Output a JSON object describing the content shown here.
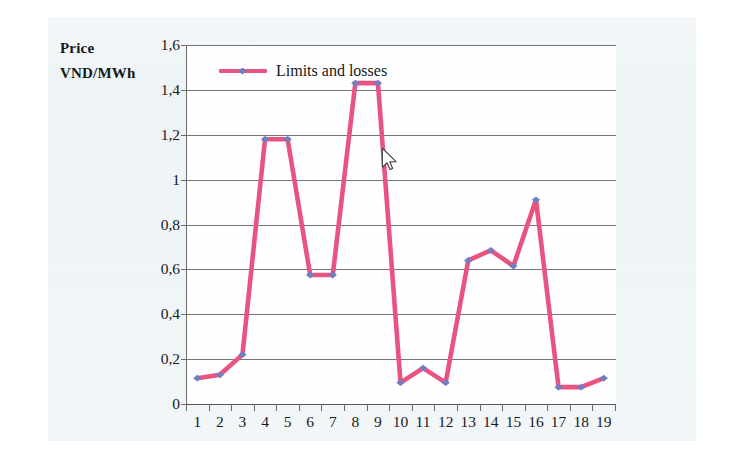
{
  "chart_data": {
    "type": "line",
    "title": "",
    "ylabel": "Price VND/MWh",
    "ylabel_lines": [
      "Price",
      "VND/MWh"
    ],
    "xlabel": "",
    "categories": [
      "1",
      "2",
      "3",
      "4",
      "5",
      "6",
      "7",
      "8",
      "9",
      "10",
      "11",
      "12",
      "13",
      "14",
      "15",
      "16",
      "17",
      "18",
      "19"
    ],
    "series": [
      {
        "name": "Limits and losses",
        "values": [
          0.115,
          0.13,
          0.22,
          1.18,
          1.18,
          0.575,
          0.575,
          1.43,
          1.43,
          0.095,
          0.16,
          0.095,
          0.64,
          0.685,
          0.615,
          0.91,
          0.075,
          0.075,
          0.115
        ],
        "line_color": "#e8547f",
        "marker_color": "#6f7fc4",
        "marker": "diamond"
      }
    ],
    "ylim": [
      0,
      1.6
    ],
    "ytick_values": [
      0,
      0.2,
      0.4,
      0.6,
      0.8,
      1.0,
      1.2,
      1.4,
      1.6
    ],
    "ytick_labels": [
      "0",
      "0,2",
      "0,4",
      "0,6",
      "0,8",
      "1",
      "1,2",
      "1,4",
      "1,6"
    ],
    "grid": true,
    "grid_axis": "y",
    "legend_position": "top-left",
    "decimal_separator": ","
  },
  "legend": {
    "entries": [
      {
        "label": "Limits and losses"
      }
    ]
  },
  "cursor": {
    "name": "mouse-pointer",
    "x": 381,
    "y": 147
  },
  "colors": {
    "line": "#e8547f",
    "marker": "#6f7fc4",
    "grid": "#74767a",
    "axis": "#6d6d6d",
    "text": "#17191d",
    "page": "#eef4f6",
    "plot_bg": "#ffffff"
  }
}
